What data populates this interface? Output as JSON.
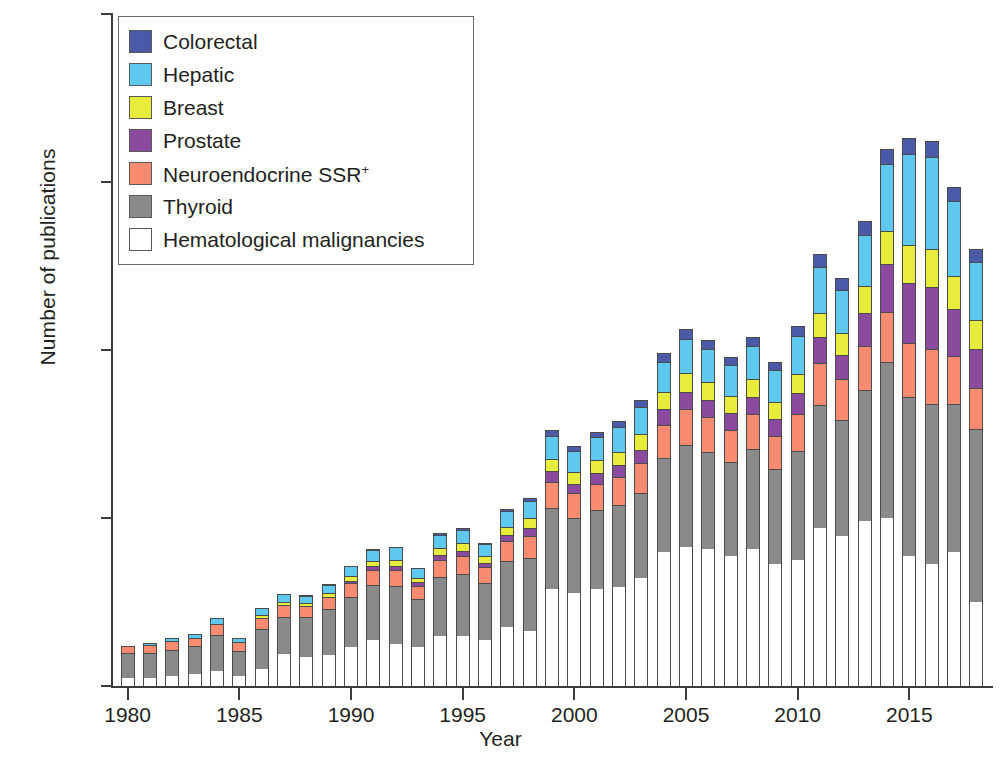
{
  "chart_data": {
    "type": "bar",
    "subtype": "stacked-bar",
    "title": "",
    "xlabel": "Year",
    "ylabel": "Number of publications",
    "ylim": [
      0,
      800
    ],
    "yticks": [
      0,
      200,
      400,
      600,
      800
    ],
    "xticks": [
      1980,
      1985,
      1990,
      1995,
      2000,
      2005,
      2010,
      2015
    ],
    "xlim": [
      1979.3,
      2018.7
    ],
    "grid": false,
    "legend_position": "top-left",
    "stack_order_bottom_to_top": [
      "Hematological malignancies",
      "Thyroid",
      "Neuroendocrine SSR+",
      "Prostate",
      "Breast",
      "Hepatic",
      "Colorectal"
    ],
    "series": [
      {
        "name": "Colorectal",
        "color": "#4a5aa8",
        "values": [
          2,
          2,
          2,
          3,
          4,
          3,
          5,
          4,
          5,
          6,
          6,
          7,
          7,
          6,
          8,
          8,
          7,
          9,
          10,
          13,
          12,
          12,
          13,
          14,
          16,
          18,
          17,
          16,
          17,
          16,
          18,
          21,
          20,
          22,
          24,
          25,
          25,
          23,
          21
        ]
      },
      {
        "name": "Hepatic",
        "color": "#5ec8ee",
        "values": [
          0,
          3,
          4,
          4,
          6,
          4,
          7,
          9,
          8,
          9,
          11,
          12,
          14,
          11,
          14,
          15,
          13,
          17,
          19,
          26,
          24,
          26,
          28,
          31,
          35,
          39,
          38,
          36,
          38,
          37,
          44,
          54,
          50,
          60,
          78,
          107,
          108,
          88,
          68
        ]
      },
      {
        "name": "Breast",
        "color": "#e8ec3d",
        "values": [
          0,
          0,
          0,
          0,
          0,
          0,
          2,
          2,
          2,
          3,
          4,
          5,
          6,
          4,
          7,
          8,
          7,
          9,
          11,
          14,
          13,
          14,
          15,
          17,
          19,
          21,
          20,
          19,
          20,
          19,
          22,
          27,
          25,
          30,
          38,
          44,
          45,
          38,
          33
        ]
      },
      {
        "name": "Prostate",
        "color": "#8c4a9e",
        "values": [
          0,
          0,
          0,
          0,
          0,
          0,
          0,
          0,
          0,
          0,
          2,
          3,
          3,
          3,
          5,
          5,
          4,
          6,
          8,
          11,
          10,
          12,
          13,
          15,
          18,
          20,
          19,
          18,
          20,
          19,
          24,
          30,
          28,
          38,
          56,
          70,
          72,
          55,
          45
        ]
      },
      {
        "name": "Neuroendocrine SSR+",
        "color": "#f98b70",
        "values": [
          8,
          8,
          9,
          9,
          11,
          9,
          12,
          13,
          12,
          14,
          15,
          17,
          18,
          15,
          19,
          20,
          18,
          22,
          25,
          30,
          28,
          30,
          32,
          35,
          38,
          41,
          40,
          38,
          40,
          38,
          43,
          49,
          47,
          52,
          58,
          63,
          64,
          55,
          48
        ]
      },
      {
        "name": "Thyroid",
        "color": "#8a8a8a",
        "values": [
          28,
          28,
          30,
          32,
          42,
          29,
          47,
          43,
          46,
          53,
          58,
          64,
          68,
          56,
          70,
          72,
          66,
          78,
          85,
          95,
          88,
          92,
          96,
          100,
          110,
          120,
          115,
          110,
          118,
          112,
          128,
          145,
          138,
          155,
          185,
          188,
          190,
          175,
          205
        ]
      },
      {
        "name": "Hematological malignancies",
        "color": "#ffffff",
        "values": [
          10,
          10,
          12,
          14,
          18,
          12,
          20,
          38,
          35,
          37,
          47,
          55,
          50,
          46,
          59,
          60,
          55,
          70,
          66,
          116,
          111,
          116,
          118,
          128,
          160,
          166,
          163,
          155,
          163,
          145,
          150,
          188,
          178,
          196,
          200,
          155,
          145,
          160,
          100
        ]
      }
    ],
    "categories": [
      1980,
      1981,
      1982,
      1983,
      1984,
      1985,
      1986,
      1987,
      1988,
      1989,
      1990,
      1991,
      1992,
      1993,
      1994,
      1995,
      1996,
      1997,
      1998,
      1999,
      2000,
      2001,
      2002,
      2003,
      2004,
      2005,
      2006,
      2007,
      2008,
      2009,
      2010,
      2011,
      2012,
      2013,
      2014,
      2015,
      2016,
      2017,
      2018
    ],
    "totals": [
      48,
      51,
      57,
      62,
      81,
      57,
      93,
      109,
      108,
      122,
      143,
      163,
      166,
      141,
      182,
      188,
      170,
      211,
      224,
      305,
      286,
      302,
      315,
      340,
      396,
      425,
      412,
      392,
      416,
      386,
      429,
      514,
      486,
      553,
      639,
      652,
      649,
      594,
      520
    ]
  },
  "legend": {
    "items": [
      {
        "label": "Colorectal",
        "color": "#4a5aa8",
        "sup": ""
      },
      {
        "label": "Hepatic",
        "color": "#5ec8ee",
        "sup": ""
      },
      {
        "label": "Breast",
        "color": "#e8ec3d",
        "sup": ""
      },
      {
        "label": "Prostate",
        "color": "#8c4a9e",
        "sup": ""
      },
      {
        "label": "Neuroendocrine SSR",
        "color": "#f98b70",
        "sup": "+"
      },
      {
        "label": "Thyroid",
        "color": "#8a8a8a",
        "sup": ""
      },
      {
        "label": "Hematological malignancies",
        "color": "#ffffff",
        "sup": ""
      }
    ]
  },
  "axes": {
    "y_title": "Number of publications",
    "x_title": "Year",
    "y_tick_labels": [
      "0",
      "200",
      "400",
      "600",
      "800"
    ],
    "x_tick_labels": [
      "1980",
      "1985",
      "1990",
      "1995",
      "2000",
      "2005",
      "2010",
      "2015"
    ]
  }
}
